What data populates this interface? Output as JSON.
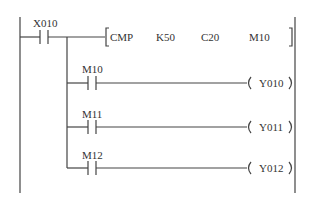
{
  "diagram": {
    "type": "ladder-logic",
    "rungs": [
      {
        "contact": "X010",
        "instruction": {
          "mnemonic": "CMP",
          "operands": [
            "K50",
            "C20",
            "M10"
          ]
        }
      },
      {
        "contact": "M10",
        "coil": "Y010"
      },
      {
        "contact": "M11",
        "coil": "Y011"
      },
      {
        "contact": "M12",
        "coil": "Y012"
      }
    ]
  },
  "colors": {
    "line": "#444444",
    "text": "#333333",
    "background": "#ffffff"
  }
}
